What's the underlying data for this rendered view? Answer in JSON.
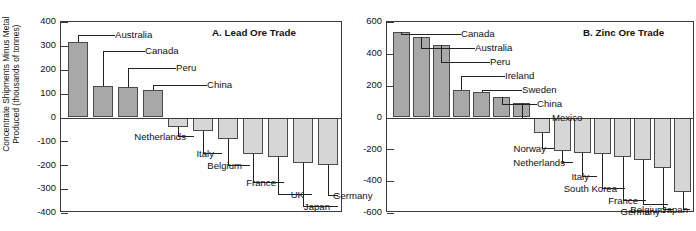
{
  "figure": {
    "ylabel": "Concentrate Shipments Minus Metal\nProduced (thousands of tonnes)"
  },
  "chart_data": [
    {
      "type": "bar",
      "title": "A. Lead Ore Trade",
      "xlabel": "",
      "ylabel": "Concentrate Shipments Minus Metal Produced (thousands of tonnes)",
      "ylim": [
        -400,
        400
      ],
      "yticks": [
        400,
        300,
        200,
        100,
        0,
        -100,
        -200,
        -300,
        -400
      ],
      "ytick_labels": [
        "400",
        "300",
        "200",
        "100",
        "0",
        "-100",
        "-200",
        "-300",
        "-400"
      ],
      "grid": false,
      "legend": "none",
      "categories": [
        "Australia",
        "Canada",
        "Peru",
        "China",
        "Netherlands",
        "Italy",
        "Belgium",
        "France",
        "UK",
        "Japan",
        "Germany"
      ],
      "values": [
        318,
        130,
        127,
        114,
        -40,
        -58,
        -88,
        -152,
        -165,
        -192,
        -197
      ]
    },
    {
      "type": "bar",
      "title": "B. Zinc Ore Trade",
      "xlabel": "",
      "ylabel": "Concentrate Shipments Minus Metal Produced (thousands of tonnes)",
      "ylim": [
        -600,
        600
      ],
      "yticks": [
        600,
        400,
        200,
        0,
        -200,
        -400,
        -600
      ],
      "ytick_labels": [
        "600",
        "400",
        "200",
        "0",
        "-200",
        "-400",
        "-600"
      ],
      "grid": false,
      "legend": "none",
      "categories": [
        "Canada",
        "Australia",
        "Peru",
        "Ireland",
        "Sweden",
        "China",
        "Mexico",
        "Norway",
        "Netherlands",
        "Italy",
        "South Korea",
        "France",
        "Germany",
        "Belgium",
        "Japan"
      ],
      "values": [
        540,
        505,
        458,
        175,
        162,
        128,
        92,
        -100,
        -208,
        -220,
        -228,
        -250,
        -265,
        -315,
        -470
      ]
    }
  ],
  "panels": {
    "left": {
      "title": "A. Lead Ore Trade",
      "ticks": [
        "400",
        "300",
        "200",
        "100",
        "0",
        "-100",
        "-200",
        "-300",
        "-400"
      ],
      "labels": [
        "Australia",
        "Canada",
        "Peru",
        "China",
        "Netherlands",
        "Italy",
        "Belgium",
        "France",
        "UK",
        "Japan",
        "Germany"
      ]
    },
    "right": {
      "title": "B. Zinc Ore Trade",
      "ticks": [
        "600",
        "400",
        "200",
        "0",
        "-200",
        "-400",
        "-600"
      ],
      "labels": [
        "Canada",
        "Australia",
        "Peru",
        "Ireland",
        "Sweden",
        "China",
        "Mexico",
        "Norway",
        "Netherlands",
        "Italy",
        "South Korea",
        "France",
        "Germany",
        "Belgium",
        "Japan"
      ]
    }
  }
}
